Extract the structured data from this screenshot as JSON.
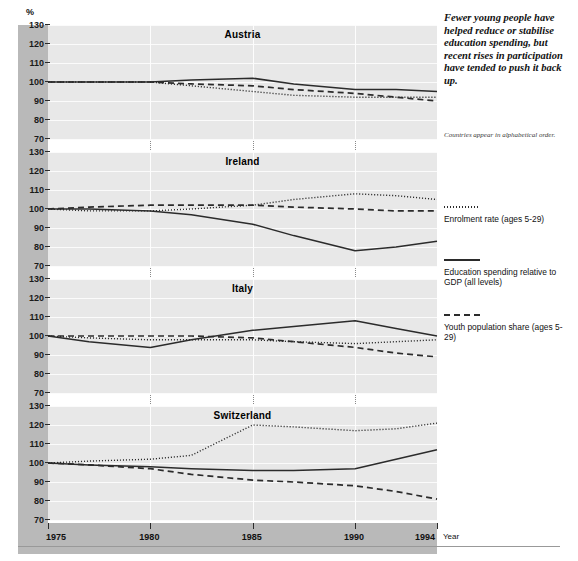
{
  "axis": {
    "y_unit": "%",
    "y_ticks": [
      130,
      120,
      110,
      100,
      90,
      80,
      70
    ],
    "x_name": "Year",
    "x_ticks": [
      "1975",
      "1980",
      "1985",
      "1990",
      "1994"
    ]
  },
  "blurb": "Fewer young people have helped reduce or stabilise education spending, but recent rises in participation have tended to push it back up.",
  "subnote": "Countries appear in alphabetical order.",
  "legend": [
    {
      "style": "dotted",
      "label": "Enrolment rate (ages 5-29)"
    },
    {
      "style": "solid",
      "label": "Education spending relative to GDP (all levels)"
    },
    {
      "style": "dashed",
      "label": "Youth population share (ages 5-29)"
    }
  ],
  "panel_titles": [
    "Austria",
    "Ireland",
    "Italy",
    "Switzerland"
  ],
  "chart_data": {
    "type": "line",
    "title": "Fewer young people have helped reduce or stabilise education spending, but recent rises in participation have tended to push it back up.",
    "xlabel": "Year",
    "ylabel": "%",
    "ylim": [
      70,
      130
    ],
    "xlim": [
      1975,
      1994
    ],
    "grid": true,
    "legend_position": "right",
    "note": "Index, 1975 = 100. Countries appear in alphabetical order.",
    "x": [
      1975,
      1977,
      1980,
      1982,
      1985,
      1987,
      1990,
      1992,
      1994
    ],
    "panels": [
      {
        "name": "Austria",
        "series": [
          {
            "name": "Enrolment rate (ages 5-29)",
            "style": "dotted",
            "values": [
              100,
              100,
              100,
              98,
              95,
              93,
              92,
              92,
              92
            ]
          },
          {
            "name": "Education spending relative to GDP (all levels)",
            "style": "solid",
            "values": [
              100,
              100,
              100,
              101,
              102,
              99,
              96,
              96,
              95
            ]
          },
          {
            "name": "Youth population share (ages 5-29)",
            "style": "dashed",
            "values": [
              100,
              100,
              100,
              99,
              98,
              96,
              94,
              92,
              90
            ]
          }
        ]
      },
      {
        "name": "Ireland",
        "series": [
          {
            "name": "Enrolment rate (ages 5-29)",
            "style": "dotted",
            "values": [
              100,
              99,
              99,
              100,
              102,
              105,
              108,
              107,
              105
            ]
          },
          {
            "name": "Education spending relative to GDP (all levels)",
            "style": "solid",
            "values": [
              100,
              100,
              99,
              97,
              92,
              86,
              78,
              80,
              83
            ]
          },
          {
            "name": "Youth population share (ages 5-29)",
            "style": "dashed",
            "values": [
              100,
              101,
              102,
              102,
              102,
              101,
              100,
              99,
              99
            ]
          }
        ]
      },
      {
        "name": "Italy",
        "series": [
          {
            "name": "Enrolment rate (ages 5-29)",
            "style": "dotted",
            "values": [
              100,
              99,
              98,
              98,
              98,
              97,
              96,
              97,
              98
            ]
          },
          {
            "name": "Education spending relative to GDP (all levels)",
            "style": "solid",
            "values": [
              100,
              97,
              94,
              98,
              103,
              105,
              108,
              104,
              100
            ]
          },
          {
            "name": "Youth population share (ages 5-29)",
            "style": "dashed",
            "values": [
              100,
              100,
              100,
              100,
              99,
              97,
              94,
              91,
              89
            ]
          }
        ]
      },
      {
        "name": "Switzerland",
        "series": [
          {
            "name": "Enrolment rate (ages 5-29)",
            "style": "dotted",
            "values": [
              100,
              101,
              102,
              104,
              120,
              119,
              117,
              118,
              121
            ]
          },
          {
            "name": "Education spending relative to GDP (all levels)",
            "style": "solid",
            "values": [
              100,
              99,
              98,
              97,
              96,
              96,
              97,
              102,
              107
            ]
          },
          {
            "name": "Youth population share (ages 5-29)",
            "style": "dashed",
            "values": [
              100,
              99,
              97,
              94,
              91,
              90,
              88,
              85,
              81
            ]
          }
        ]
      }
    ]
  }
}
